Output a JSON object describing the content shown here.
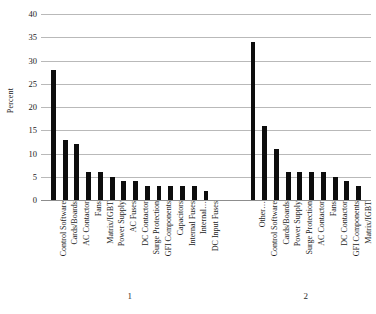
{
  "chart_data": {
    "type": "bar",
    "title": "",
    "xlabel": "",
    "ylabel": "Percent",
    "ylim": [
      0,
      40
    ],
    "ytick_step": 5,
    "yticks": [
      0,
      5,
      10,
      15,
      20,
      25,
      30,
      35,
      40
    ],
    "ytick_labels": [
      "0",
      "5",
      "10",
      "15",
      "20",
      "25",
      "30",
      "35",
      "40"
    ],
    "grid": true,
    "legend": false,
    "bar_color": "#0d0d0d",
    "gridline_color": "#b9b9b9",
    "groups": [
      {
        "name": "1",
        "categories": [
          "Control Software",
          "Cards/Boards",
          "AC Contactor",
          "Fans",
          "Matrix/IGBT",
          "Power Supply",
          "AC Fuses",
          "DC Contactor",
          "Surge Protection",
          "GFI Components",
          "Capacitors",
          "Internal Fuses",
          "Internal…",
          "DC Input Fuses"
        ],
        "values": [
          28,
          13,
          12,
          6,
          6,
          5,
          4,
          4,
          3,
          3,
          3,
          3,
          3,
          2
        ]
      },
      {
        "name": "2",
        "categories": [
          "Other…",
          "Control Software",
          "Cards/Boards",
          "Power Supply",
          "Surge Protection",
          "AC Contactor",
          "Fans",
          "DC Contactor",
          "GFI Components",
          "Matrix/IGBT"
        ],
        "values": [
          34,
          16,
          11,
          6,
          6,
          6,
          6,
          5,
          4,
          3
        ]
      }
    ]
  }
}
